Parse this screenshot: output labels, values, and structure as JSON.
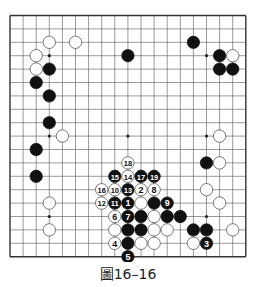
{
  "diagram": {
    "type": "go-board",
    "size": 19,
    "caption": "圖16–16",
    "colors": {
      "line": "#555555",
      "black": "#111111",
      "white": "#ffffff",
      "edge": "#333333"
    },
    "star_points": [
      [
        3,
        3
      ],
      [
        9,
        3
      ],
      [
        15,
        3
      ],
      [
        3,
        9
      ],
      [
        9,
        9
      ],
      [
        15,
        9
      ],
      [
        3,
        15
      ],
      [
        9,
        15
      ],
      [
        15,
        15
      ]
    ],
    "stones": [
      {
        "c": 3,
        "r": 2,
        "color": "white"
      },
      {
        "c": 5,
        "r": 2,
        "color": "white"
      },
      {
        "c": 2,
        "r": 3,
        "color": "white"
      },
      {
        "c": 2,
        "r": 4,
        "color": "white"
      },
      {
        "c": 3,
        "r": 4,
        "color": "black"
      },
      {
        "c": 2,
        "r": 5,
        "color": "black"
      },
      {
        "c": 3,
        "r": 6,
        "color": "black"
      },
      {
        "c": 3,
        "r": 8,
        "color": "black"
      },
      {
        "c": 4,
        "r": 9,
        "color": "white"
      },
      {
        "c": 2,
        "r": 10,
        "color": "black"
      },
      {
        "c": 2,
        "r": 12,
        "color": "black"
      },
      {
        "c": 3,
        "r": 14,
        "color": "white"
      },
      {
        "c": 3,
        "r": 16,
        "color": "white"
      },
      {
        "c": 9,
        "r": 3,
        "color": "black"
      },
      {
        "c": 14,
        "r": 2,
        "color": "black"
      },
      {
        "c": 16,
        "r": 3,
        "color": "black"
      },
      {
        "c": 17,
        "r": 3,
        "color": "white"
      },
      {
        "c": 16,
        "r": 4,
        "color": "black"
      },
      {
        "c": 17,
        "r": 4,
        "color": "black"
      },
      {
        "c": 16,
        "r": 9,
        "color": "white"
      },
      {
        "c": 15,
        "r": 11,
        "color": "black"
      },
      {
        "c": 16,
        "r": 11,
        "color": "white"
      },
      {
        "c": 15,
        "r": 13,
        "color": "white"
      },
      {
        "c": 16,
        "r": 14,
        "color": "white"
      },
      {
        "c": 14,
        "r": 16,
        "color": "black"
      },
      {
        "c": 15,
        "r": 16,
        "color": "black"
      },
      {
        "c": 17,
        "r": 16,
        "color": "white"
      },
      {
        "c": 14,
        "r": 17,
        "color": "white"
      },
      {
        "c": 15,
        "r": 17,
        "color": "black",
        "label": "3"
      },
      {
        "c": 9,
        "r": 11,
        "color": "white",
        "label": "18"
      },
      {
        "c": 8,
        "r": 12,
        "color": "black",
        "label": "15"
      },
      {
        "c": 9,
        "r": 12,
        "color": "white",
        "label": "14"
      },
      {
        "c": 10,
        "r": 12,
        "color": "black",
        "label": "17"
      },
      {
        "c": 11,
        "r": 12,
        "color": "black",
        "label": "19"
      },
      {
        "c": 7,
        "r": 13,
        "color": "white",
        "label": "16"
      },
      {
        "c": 8,
        "r": 13,
        "color": "white",
        "label": "10"
      },
      {
        "c": 9,
        "r": 13,
        "color": "black",
        "label": "13"
      },
      {
        "c": 10,
        "r": 13,
        "color": "white",
        "label": "2"
      },
      {
        "c": 11,
        "r": 13,
        "color": "white",
        "label": "8"
      },
      {
        "c": 7,
        "r": 14,
        "color": "white",
        "label": "12"
      },
      {
        "c": 8,
        "r": 14,
        "color": "black",
        "label": "11"
      },
      {
        "c": 9,
        "r": 14,
        "color": "black",
        "label": "1"
      },
      {
        "c": 10,
        "r": 14,
        "color": "white"
      },
      {
        "c": 11,
        "r": 14,
        "color": "black"
      },
      {
        "c": 12,
        "r": 14,
        "color": "black",
        "label": "9"
      },
      {
        "c": 8,
        "r": 15,
        "color": "white",
        "label": "6"
      },
      {
        "c": 9,
        "r": 15,
        "color": "black",
        "label": "7"
      },
      {
        "c": 10,
        "r": 15,
        "color": "black"
      },
      {
        "c": 11,
        "r": 15,
        "color": "white"
      },
      {
        "c": 12,
        "r": 15,
        "color": "black"
      },
      {
        "c": 13,
        "r": 15,
        "color": "black"
      },
      {
        "c": 8,
        "r": 16,
        "color": "white"
      },
      {
        "c": 9,
        "r": 16,
        "color": "black"
      },
      {
        "c": 10,
        "r": 16,
        "color": "black"
      },
      {
        "c": 11,
        "r": 16,
        "color": "white"
      },
      {
        "c": 12,
        "r": 16,
        "color": "white"
      },
      {
        "c": 8,
        "r": 17,
        "color": "white",
        "label": "4"
      },
      {
        "c": 9,
        "r": 17,
        "color": "black"
      },
      {
        "c": 10,
        "r": 17,
        "color": "white"
      },
      {
        "c": 11,
        "r": 17,
        "color": "white"
      },
      {
        "c": 9,
        "r": 18,
        "color": "black",
        "label": "5"
      }
    ]
  }
}
